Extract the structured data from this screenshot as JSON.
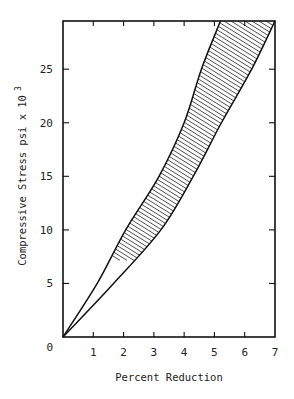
{
  "chart_data": {
    "type": "area",
    "title": "",
    "xlabel": "Percent Reduction",
    "ylabel": "Compressive Stress  psi x 10",
    "ylabel_superscript": "3",
    "xlim": [
      0,
      7
    ],
    "ylim": [
      0,
      29.5
    ],
    "x_ticks": [
      1,
      2,
      3,
      4,
      5,
      6,
      7
    ],
    "x_tick_labels": [
      "1",
      "2",
      "3",
      "4",
      "5",
      "6",
      "7"
    ],
    "y_ticks": [
      0,
      5,
      10,
      15,
      20,
      25
    ],
    "y_tick_labels": [
      "0",
      "5",
      "10",
      "15",
      "20",
      "25"
    ],
    "grid": false,
    "legend": null,
    "fill_style": "diagonal-hatch",
    "series": [
      {
        "name": "upper bound",
        "points": [
          [
            0,
            0
          ],
          [
            1.13,
            5
          ],
          [
            2.07,
            10
          ],
          [
            3.17,
            15
          ],
          [
            4.0,
            20
          ],
          [
            4.57,
            25
          ],
          [
            5.2,
            29.5
          ]
        ]
      },
      {
        "name": "lower bound",
        "points": [
          [
            0,
            0
          ],
          [
            1.67,
            5
          ],
          [
            3.23,
            10
          ],
          [
            4.3,
            15
          ],
          [
            5.23,
            20
          ],
          [
            6.23,
            25
          ],
          [
            7.0,
            29.5
          ]
        ]
      }
    ]
  }
}
